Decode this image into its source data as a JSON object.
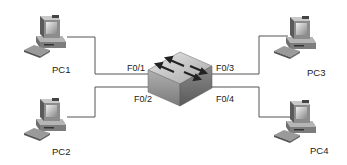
{
  "diagram": {
    "type": "network-topology",
    "switch": {
      "name": "switch",
      "ports": [
        {
          "id": "f01",
          "label": "F0/1",
          "connects_to": "PC1"
        },
        {
          "id": "f02",
          "label": "F0/2",
          "connects_to": "PC2"
        },
        {
          "id": "f03",
          "label": "F0/3",
          "connects_to": "PC3"
        },
        {
          "id": "f04",
          "label": "F0/4",
          "connects_to": "PC4"
        }
      ]
    },
    "hosts": [
      {
        "id": "pc1",
        "label": "PC1"
      },
      {
        "id": "pc2",
        "label": "PC2"
      },
      {
        "id": "pc3",
        "label": "PC3"
      },
      {
        "id": "pc4",
        "label": "PC4"
      }
    ],
    "colors": {
      "line": "#555555",
      "switch_top": "#c8c8c8",
      "switch_side": "#8a8a8a",
      "pc_body": "#9a9a9a",
      "text": "#222222"
    }
  }
}
